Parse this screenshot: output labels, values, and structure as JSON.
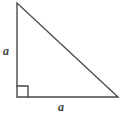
{
  "figure": {
    "name": "right-triangle-with-equal-legs",
    "background_color": "#ffffff",
    "stroke_color": "#4a4a4a",
    "stroke_width": 1.4,
    "text_color": "#3f3f3f",
    "labels": {
      "vertical_leg": "a",
      "horizontal_leg": "a"
    },
    "geometry": {
      "apex": [
        17,
        3
      ],
      "right_angle_vertex": [
        17,
        97
      ],
      "base_right_vertex": [
        118,
        97
      ],
      "right_angle_marker_size": 11,
      "vertical_leg_length_px": 94,
      "horizontal_leg_length_px": 101
    },
    "icons": {
      "right_angle_marker": "right-angle-square-icon"
    }
  }
}
